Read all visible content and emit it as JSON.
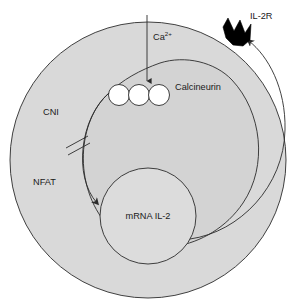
{
  "diagram": {
    "type": "cell-signaling-pathway",
    "colors": {
      "cell_fill": "#d9d9d9",
      "cytoplasm_inner_fill": "#d3d3d3",
      "nucleus_fill": "#dcdcdc",
      "stroke": "#2b2b2b",
      "receptor_fill": "#000000",
      "protein_fill": "#ffffff",
      "background": "#ffffff",
      "text": "#1a1a1a"
    },
    "labels": {
      "calcium": "Ca",
      "calcium_charge": "2+",
      "calcineurin": "Calcineurin",
      "cni": "CNI",
      "nfat": "NFAT",
      "mrna_il2": "mRNA IL-2",
      "il2r": "IL-2R"
    },
    "elements": {
      "cell_membrane": "cell-membrane",
      "cytoplasm_compartment": "cytoplasm-compartment",
      "nucleus": "nucleus",
      "calcium_influx_arrow": "calcium-influx-arrow",
      "calcineurin_complex": "calcineurin-subunit-circles",
      "calcineurin_subunit_count": 3,
      "nfat_translocation_arrow": "nfat-translocation-arrow",
      "inhibition_marks": "cni-inhibition-double-slash",
      "inhibition_mark_count": 2,
      "il2_secretion_arrow": "il2-secretion-arrow",
      "il2_receptor": "il2-receptor-spike"
    }
  }
}
